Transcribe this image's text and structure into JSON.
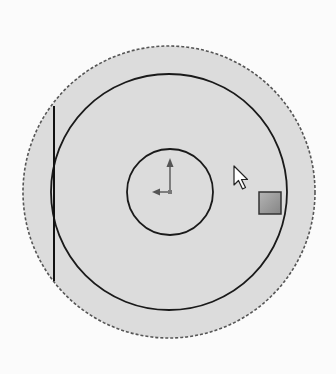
{
  "view": {
    "type": "cad-sketch-viewport",
    "background_color": "#fbfbfb",
    "fill_color": "#dcdcdc",
    "line_color": "#1a1a1a",
    "dashed_color": "#555555"
  },
  "sketch": {
    "outer_circle": {
      "cx": 169,
      "cy": 192,
      "r": 146,
      "style": "dashed"
    },
    "middle_circle": {
      "cx": 169,
      "cy": 192,
      "r": 118,
      "style": "solid"
    },
    "inner_circle": {
      "cx": 170,
      "cy": 192,
      "r": 43,
      "style": "solid"
    },
    "vertical_line": {
      "x": 54,
      "y1": 106,
      "y2": 281
    },
    "origin": {
      "x": 170,
      "y": 192,
      "up_length": 32,
      "left_length": 18
    }
  },
  "cursor": {
    "icon": "arrow-pointer-icon",
    "x": 234,
    "y": 166
  },
  "handle": {
    "icon": "drag-handle-square",
    "x": 259,
    "y": 192,
    "size": 22,
    "color": "#9a9a9a"
  }
}
